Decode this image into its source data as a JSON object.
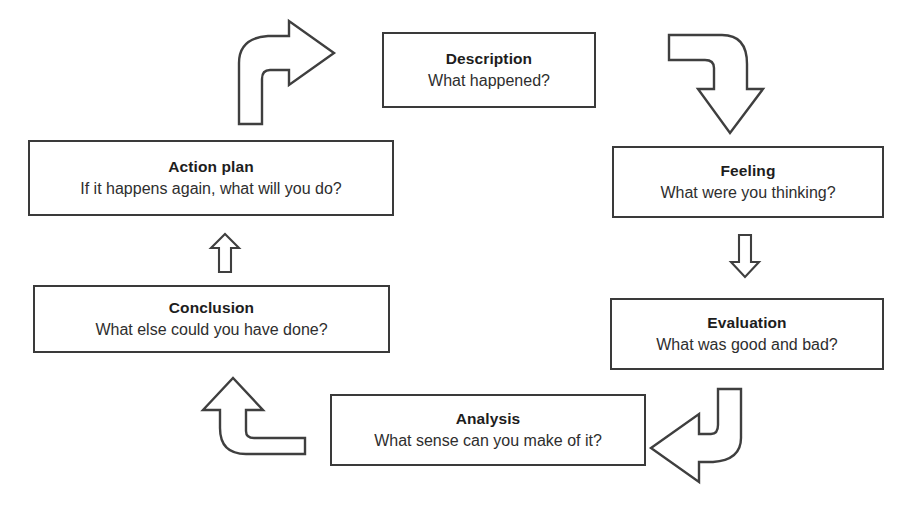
{
  "diagram": {
    "name": "Gibbs Reflective Cycle",
    "type": "cycle-flow-diagram",
    "background_color": "#ffffff",
    "box_border_color": "#3a3a3a",
    "box_fill_color": "#ffffff",
    "arrow_stroke_color": "#3f3f3f",
    "arrow_fill_color": "#ffffff",
    "text_color": "#2b2b2b"
  },
  "nodes": [
    {
      "id": "description",
      "title": "Description",
      "prompt": "What happened?",
      "x": 382,
      "y": 32,
      "width": 214,
      "height": 76
    },
    {
      "id": "feeling",
      "title": "Feeling",
      "prompt": "What were you thinking?",
      "x": 612,
      "y": 146,
      "width": 272,
      "height": 72
    },
    {
      "id": "evaluation",
      "title": "Evaluation",
      "prompt": "What was good and bad?",
      "x": 610,
      "y": 298,
      "width": 274,
      "height": 72
    },
    {
      "id": "analysis",
      "title": "Analysis",
      "prompt": "What sense can you make of it?",
      "x": 330,
      "y": 394,
      "width": 316,
      "height": 72
    },
    {
      "id": "conclusion",
      "title": "Conclusion",
      "prompt": "What else could you have done?",
      "x": 33,
      "y": 285,
      "width": 357,
      "height": 68
    },
    {
      "id": "action_plan",
      "title": "Action plan",
      "prompt": "If it happens again, what will you do?",
      "x": 28,
      "y": 140,
      "width": 366,
      "height": 76
    }
  ],
  "arrows": [
    {
      "id": "action-plan-to-description",
      "shape": "curve-up-right",
      "from": "action_plan",
      "to": "description"
    },
    {
      "id": "description-to-feeling",
      "shape": "curve-right-down",
      "from": "description",
      "to": "feeling"
    },
    {
      "id": "feeling-to-evaluation",
      "shape": "straight-down",
      "from": "feeling",
      "to": "evaluation"
    },
    {
      "id": "evaluation-to-analysis",
      "shape": "curve-down-left",
      "from": "evaluation",
      "to": "analysis"
    },
    {
      "id": "analysis-to-conclusion",
      "shape": "curve-left-up",
      "from": "analysis",
      "to": "conclusion"
    },
    {
      "id": "conclusion-to-action-plan",
      "shape": "straight-up",
      "from": "conclusion",
      "to": "action_plan"
    }
  ]
}
